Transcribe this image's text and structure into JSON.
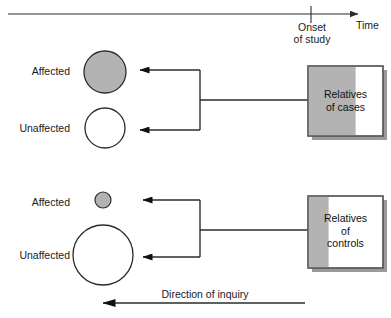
{
  "diagram": {
    "title_axis": {
      "time_label": "Time",
      "onset_label_line1": "Onset",
      "onset_label_line2": "of study"
    },
    "groups": [
      {
        "name": "cases-group",
        "affected_label": "Affected",
        "unaffected_label": "Unaffected",
        "box_text": "Relatives\nof cases",
        "affected_circle": {
          "cx": 105,
          "cy": 72,
          "r": 21,
          "fill": "#b3b3b3",
          "stroke": "#2b2b2b"
        },
        "unaffected_circle": {
          "cx": 105,
          "cy": 128,
          "r": 20,
          "fill": "#ffffff",
          "stroke": "#2b2b2b"
        },
        "box": {
          "x": 308,
          "y": 66,
          "w": 75,
          "h": 70,
          "shaded_w": 47
        }
      },
      {
        "name": "controls-group",
        "affected_label": "Affected",
        "unaffected_label": "Unaffected",
        "box_text": "Relatives\nof\ncontrols",
        "affected_circle": {
          "cx": 103,
          "cy": 200,
          "r": 8,
          "fill": "#b3b3b3",
          "stroke": "#2b2b2b"
        },
        "unaffected_circle": {
          "cx": 103,
          "cy": 255,
          "r": 30,
          "fill": "#ffffff",
          "stroke": "#2b2b2b"
        },
        "box": {
          "x": 308,
          "y": 196,
          "w": 75,
          "h": 72,
          "shaded_w": 20
        }
      }
    ],
    "footer": {
      "direction_label": "Direction of inquiry"
    },
    "colors": {
      "shade_gray": "#b3b3b3",
      "line_dark": "#2b2b2b",
      "box_border": "#5a5a5a",
      "shadow": "#9a9a9a",
      "background": "#ffffff",
      "text": "#1a1a1a"
    }
  }
}
